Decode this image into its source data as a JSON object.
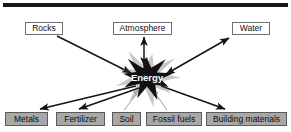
{
  "canvas": {
    "width": 291,
    "height": 132,
    "background": "#ffffff"
  },
  "top_rule": {
    "name": "top-divider-bar",
    "x": 3,
    "y": 3,
    "width": 285,
    "height": 4,
    "color": "#171717"
  },
  "center": {
    "label": "Energy",
    "shape": "starburst",
    "fill": "#111111",
    "text_color": "#ffffff",
    "cx": 147,
    "cy": 77
  },
  "nodes": [
    {
      "id": "rocks",
      "label": "Rocks",
      "row": "top",
      "x": 25,
      "y": 22,
      "width": 38,
      "fill": "#ffffff",
      "border": "#6e6e6e"
    },
    {
      "id": "atmosphere",
      "label": "Atmosphere",
      "row": "top",
      "x": 113,
      "y": 22,
      "width": 59,
      "fill": "#ffffff",
      "border": "#6e6e6e"
    },
    {
      "id": "water",
      "label": "Water",
      "row": "top",
      "x": 232,
      "y": 22,
      "width": 38,
      "fill": "#ffffff",
      "border": "#6e6e6e"
    },
    {
      "id": "metals",
      "label": "Metals",
      "row": "bottom",
      "x": 5,
      "y": 112,
      "width": 43,
      "fill": "#a8a8a8",
      "border": "#5a5a5a"
    },
    {
      "id": "fertilizer",
      "label": "Fertilizer",
      "row": "bottom",
      "x": 56,
      "y": 112,
      "width": 49,
      "fill": "#a8a8a8",
      "border": "#5a5a5a"
    },
    {
      "id": "soil",
      "label": "Soil",
      "row": "bottom",
      "x": 112,
      "y": 112,
      "width": 29,
      "fill": "#a8a8a8",
      "border": "#5a5a5a"
    },
    {
      "id": "fossil-fuels",
      "label": "Fossil fuels",
      "row": "bottom",
      "x": 146,
      "y": 112,
      "width": 56,
      "fill": "#a8a8a8",
      "border": "#5a5a5a"
    },
    {
      "id": "building-materials",
      "label": "Building materials",
      "row": "bottom",
      "x": 206,
      "y": 112,
      "width": 81,
      "fill": "#a8a8a8",
      "border": "#5a5a5a"
    }
  ],
  "edges": [
    {
      "id": "rocks-to-energy",
      "from": "rocks",
      "to": "energy",
      "x1": 57,
      "y1": 36,
      "x2": 131,
      "y2": 73,
      "arrow": "end",
      "style": "solid",
      "color": "#141414"
    },
    {
      "id": "atmosphere-energy",
      "from": "atmosphere",
      "to": "energy",
      "x1": 144,
      "y1": 37,
      "x2": 144,
      "y2": 66,
      "arrow": "both",
      "style": "solid",
      "color": "#141414"
    },
    {
      "id": "water-energy",
      "from": "water",
      "to": "energy",
      "x1": 229,
      "y1": 38,
      "x2": 166,
      "y2": 74,
      "arrow": "both",
      "style": "solid",
      "color": "#141414"
    },
    {
      "id": "energy-to-metals",
      "from": "energy",
      "to": "metals",
      "x1": 136,
      "y1": 86,
      "x2": 40,
      "y2": 109,
      "arrow": "end",
      "style": "solid",
      "color": "#141414"
    },
    {
      "id": "energy-to-fertilizer",
      "from": "energy",
      "to": "fertilizer",
      "x1": 139,
      "y1": 88,
      "x2": 79,
      "y2": 109,
      "arrow": "end",
      "style": "solid",
      "color": "#141414"
    },
    {
      "id": "soil-to-energy",
      "from": "soil",
      "to": "energy",
      "x1": 124,
      "y1": 110,
      "x2": 140,
      "y2": 90,
      "arrow": "end",
      "style": "outline",
      "color": "#9a9a9a"
    },
    {
      "id": "fossil-fuels-to-energy",
      "from": "fossil-fuels",
      "to": "energy",
      "x1": 167,
      "y1": 110,
      "x2": 153,
      "y2": 90,
      "arrow": "end",
      "style": "outline",
      "color": "#9a9a9a"
    },
    {
      "id": "energy-to-building-materials",
      "from": "energy",
      "to": "building-materials",
      "x1": 161,
      "y1": 86,
      "x2": 225,
      "y2": 109,
      "arrow": "end",
      "style": "solid",
      "color": "#141414"
    }
  ]
}
